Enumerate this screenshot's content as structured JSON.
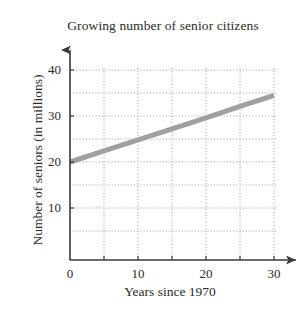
{
  "chart_data": {
    "type": "line",
    "title": "Growing number of senior citizens",
    "xlabel": "Years since 1970",
    "ylabel": "Number of seniors (in millions)",
    "xlim": [
      0,
      30
    ],
    "ylim": [
      0,
      40
    ],
    "xticks": [
      0,
      10,
      20,
      30
    ],
    "xtick_labels": [
      "0",
      "10",
      "20",
      "30"
    ],
    "yticks": [
      10,
      20,
      30,
      40
    ],
    "ytick_labels": [
      "10",
      "20",
      "30",
      "40"
    ],
    "grid": true,
    "grid_style": "dotted",
    "grid_x_step": 5,
    "grid_y_step": 5,
    "legend": false,
    "axes_arrows": true,
    "series": [
      {
        "name": "Seniors trend line",
        "color": "#a0a0a0",
        "x": [
          0,
          5,
          10,
          15,
          20,
          25,
          30
        ],
        "y": [
          20.0,
          22.4,
          24.8,
          27.2,
          29.6,
          32.1,
          34.5
        ]
      }
    ]
  },
  "labels": {
    "y0": "40",
    "y1": "30",
    "y2": "20",
    "y3": "10",
    "x0": "0",
    "x1": "10",
    "x2": "20",
    "x3": "30"
  }
}
